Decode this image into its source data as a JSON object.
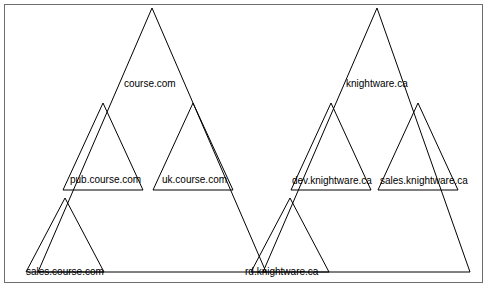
{
  "diagram": {
    "type": "dns-domain-hierarchy-triangles",
    "frame": {
      "stroke": "#6d6d6d"
    },
    "triangle_stroke": "#000000",
    "triangles": [
      {
        "name": "course-com-triangle",
        "apex_x": 152,
        "apex_y": 8,
        "left_x": 38,
        "left_y": 272,
        "right_x": 266,
        "right_y": 272
      },
      {
        "name": "pub-course-com-triangle",
        "apex_x": 103,
        "apex_y": 103,
        "left_x": 63,
        "left_y": 190,
        "right_x": 143,
        "right_y": 190
      },
      {
        "name": "uk-course-com-triangle",
        "apex_x": 193,
        "apex_y": 103,
        "left_x": 153,
        "left_y": 190,
        "right_x": 233,
        "right_y": 190
      },
      {
        "name": "sales-course-com-triangle",
        "apex_x": 65,
        "apex_y": 198,
        "left_x": 26,
        "left_y": 272,
        "right_x": 104,
        "right_y": 272
      },
      {
        "name": "knightware-ca-triangle",
        "apex_x": 377,
        "apex_y": 8,
        "left_x": 263,
        "left_y": 272,
        "right_x": 470,
        "right_y": 272
      },
      {
        "name": "dev-knightware-ca-triangle",
        "apex_x": 331,
        "apex_y": 103,
        "left_x": 291,
        "left_y": 190,
        "right_x": 371,
        "right_y": 190
      },
      {
        "name": "sales-knightware-ca-triangle",
        "apex_x": 418,
        "apex_y": 103,
        "left_x": 378,
        "left_y": 190,
        "right_x": 458,
        "right_y": 190
      },
      {
        "name": "rd-knightware-ca-triangle",
        "apex_x": 290,
        "apex_y": 198,
        "left_x": 251,
        "left_y": 272,
        "right_x": 329,
        "right_y": 272
      }
    ],
    "labels": [
      {
        "name": "label-course-com",
        "text": "course.com",
        "x": 124,
        "y": 78
      },
      {
        "name": "label-knightware-ca",
        "text": "knightware.ca",
        "x": 346,
        "y": 78
      },
      {
        "name": "label-pub-course-com",
        "text": "pub.course.com",
        "x": 70,
        "y": 174
      },
      {
        "name": "label-uk-course-com",
        "text": "uk.course.com",
        "x": 162,
        "y": 174
      },
      {
        "name": "label-dev-knightware-ca",
        "text": "dev.knightware.ca",
        "x": 292,
        "y": 175
      },
      {
        "name": "label-sales-knightware-ca",
        "text": "sales.knightware.ca",
        "x": 380,
        "y": 175
      },
      {
        "name": "label-sales-course-com",
        "text": "sales.course.com",
        "x": 26,
        "y": 266
      },
      {
        "name": "label-rd-knightware-ca",
        "text": "rd.knightware.ca",
        "x": 245,
        "y": 266
      }
    ]
  }
}
